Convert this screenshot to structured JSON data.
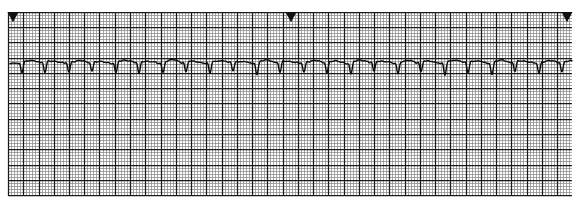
{
  "document": {
    "kind": "ecg-rhythm-strip",
    "title": "ECG Rhythm Strip",
    "lead_label": "",
    "background_color": "#ffffff"
  },
  "paper": {
    "grid_color_fine": "#8a8a8a",
    "grid_color_bold": "#1a1a1a",
    "trace_color": "#0a0a0a",
    "fine_cell_px": 3.05,
    "bold_every": 5,
    "grid_left_px": 8,
    "grid_top_px": 12,
    "grid_right_px": 572,
    "grid_bottom_px": 196,
    "border": "none"
  },
  "markers": [
    {
      "name": "event-marker-left",
      "x_px": 13,
      "y_px": 13,
      "shape": "triangle-down",
      "color": "#111111",
      "size_px": 11
    },
    {
      "name": "event-marker-middle",
      "x_px": 291,
      "y_px": 13,
      "shape": "triangle-down",
      "color": "#111111",
      "size_px": 11
    },
    {
      "name": "event-marker-right",
      "x_px": 567,
      "y_px": 13,
      "shape": "triangle-down",
      "color": "#111111",
      "size_px": 11
    }
  ],
  "chart_data": {
    "type": "line",
    "title": "ECG Rhythm Strip",
    "subtitle": "",
    "xlabel": "Time (s)",
    "ylabel": "Amplitude (mV)",
    "grid": true,
    "legend": "none",
    "paper_speed_mm_per_s": 25,
    "gain_mm_per_mV": 10,
    "mm_per_px": 0.82,
    "duration_s": 18.5,
    "baseline_y_px": 64,
    "trace_x_start_px": 10,
    "trace_x_end_px": 572,
    "trace_width_px": 1.4,
    "beat_count": 24,
    "mean_rr_px": 23.4,
    "rhythm_description": "regular narrow-complex rhythm, predominantly negative QRS deflection with low-amplitude rounded T waves",
    "annotations": [],
    "beats": [
      {
        "index": 1,
        "r_x_px": 22,
        "qrs_depth_px": 9,
        "t_height_px": 3.0,
        "rr_px": 0
      },
      {
        "index": 2,
        "r_x_px": 45,
        "qrs_depth_px": 10,
        "t_height_px": 3.4,
        "rr_px": 23
      },
      {
        "index": 3,
        "r_x_px": 69,
        "qrs_depth_px": 9,
        "t_height_px": 3.0,
        "rr_px": 24
      },
      {
        "index": 4,
        "r_x_px": 92,
        "qrs_depth_px": 8,
        "t_height_px": 2.6,
        "rr_px": 23
      },
      {
        "index": 5,
        "r_x_px": 116,
        "qrs_depth_px": 10,
        "t_height_px": 3.6,
        "rr_px": 24
      },
      {
        "index": 6,
        "r_x_px": 139,
        "qrs_depth_px": 11,
        "t_height_px": 3.2,
        "rr_px": 23
      },
      {
        "index": 7,
        "r_x_px": 163,
        "qrs_depth_px": 9,
        "t_height_px": 4.0,
        "rr_px": 24
      },
      {
        "index": 8,
        "r_x_px": 186,
        "qrs_depth_px": 9,
        "t_height_px": 2.8,
        "rr_px": 23
      },
      {
        "index": 9,
        "r_x_px": 210,
        "qrs_depth_px": 10,
        "t_height_px": 3.2,
        "rr_px": 24
      },
      {
        "index": 10,
        "r_x_px": 233,
        "qrs_depth_px": 8,
        "t_height_px": 2.6,
        "rr_px": 23
      },
      {
        "index": 11,
        "r_x_px": 257,
        "qrs_depth_px": 11,
        "t_height_px": 3.8,
        "rr_px": 24
      },
      {
        "index": 12,
        "r_x_px": 280,
        "qrs_depth_px": 10,
        "t_height_px": 3.0,
        "rr_px": 23
      },
      {
        "index": 13,
        "r_x_px": 304,
        "qrs_depth_px": 9,
        "t_height_px": 3.4,
        "rr_px": 24
      },
      {
        "index": 14,
        "r_x_px": 327,
        "qrs_depth_px": 10,
        "t_height_px": 3.0,
        "rr_px": 23
      },
      {
        "index": 15,
        "r_x_px": 351,
        "qrs_depth_px": 11,
        "t_height_px": 4.0,
        "rr_px": 24
      },
      {
        "index": 16,
        "r_x_px": 374,
        "qrs_depth_px": 9,
        "t_height_px": 3.0,
        "rr_px": 23
      },
      {
        "index": 17,
        "r_x_px": 398,
        "qrs_depth_px": 10,
        "t_height_px": 3.4,
        "rr_px": 24
      },
      {
        "index": 18,
        "r_x_px": 421,
        "qrs_depth_px": 9,
        "t_height_px": 2.8,
        "rr_px": 23
      },
      {
        "index": 19,
        "r_x_px": 445,
        "qrs_depth_px": 12,
        "t_height_px": 4.2,
        "rr_px": 24
      },
      {
        "index": 20,
        "r_x_px": 468,
        "qrs_depth_px": 10,
        "t_height_px": 3.0,
        "rr_px": 23
      },
      {
        "index": 21,
        "r_x_px": 492,
        "qrs_depth_px": 11,
        "t_height_px": 4.0,
        "rr_px": 24
      },
      {
        "index": 22,
        "r_x_px": 515,
        "qrs_depth_px": 9,
        "t_height_px": 3.0,
        "rr_px": 23
      },
      {
        "index": 23,
        "r_x_px": 539,
        "qrs_depth_px": 10,
        "t_height_px": 3.6,
        "rr_px": 24
      },
      {
        "index": 24,
        "r_x_px": 562,
        "qrs_depth_px": 9,
        "t_height_px": 2.8,
        "rr_px": 23
      }
    ]
  }
}
